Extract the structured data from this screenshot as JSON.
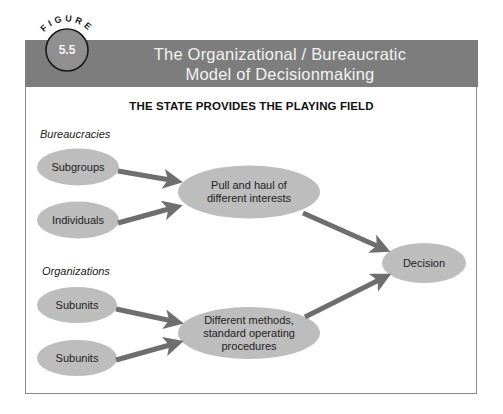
{
  "figure": {
    "badge_word": "FIGURE",
    "number": "5.5",
    "title_line1": "The Organizational / Bureaucratic",
    "title_line2": "Model of Decisionmaking"
  },
  "subheading": "THE STATE PROVIDES THE PLAYING FIELD",
  "groups": {
    "bureaucracies": "Bureaucracies",
    "organizations": "Organizations"
  },
  "nodes": {
    "subgroups": "Subgroups",
    "individuals": "Individuals",
    "pull_haul_line1": "Pull and haul of",
    "pull_haul_line2": "different interests",
    "subunits_1": "Subunits",
    "subunits_2": "Subunits",
    "methods_line1": "Different methods,",
    "methods_line2": "standard operating",
    "methods_line3": "procedures",
    "decision": "Decision"
  },
  "colors": {
    "header_bg": "#7d7d7d",
    "node_fill": "#bdbdbd",
    "arrow": "#6e6e6e",
    "badge_fill": "#8f8f8f",
    "badge_border": "#1a1a1a"
  }
}
